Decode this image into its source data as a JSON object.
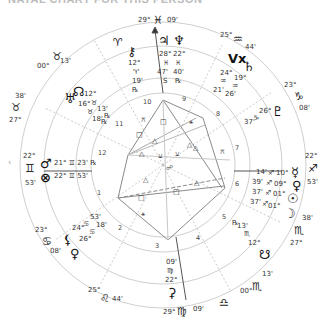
{
  "title": "NATAL CHART FOR THIS PERSON",
  "nav": {
    "left_arrow": "‹"
  },
  "colors": {
    "ring": "#cccccc",
    "axis": "#555555",
    "aspect_hard": "#888888",
    "aspect_soft": "#aaaaaa",
    "text": "#333333"
  },
  "cusps": {
    "mc": {
      "deg": "29°",
      "sign": "♓",
      "min": "09'"
    },
    "h11": {
      "deg": "00°",
      "sign": "♉",
      "min": "13'"
    },
    "h12": {
      "deg": "27°",
      "sign": "♉",
      "min": "38'"
    },
    "asc": {
      "deg": "22°",
      "sign": "♊",
      "min": "53'"
    },
    "h2": {
      "deg": "23°",
      "sign": "♋",
      "min": "08'"
    },
    "h3": {
      "deg": "25°",
      "sign": "♌",
      "min": "44'"
    },
    "ic": {
      "deg": "29°",
      "sign": "♍",
      "min": "09'"
    },
    "h5": {
      "deg": "00°",
      "sign": "♏",
      "min": "13'"
    },
    "h6": {
      "deg": "27°",
      "sign": "♏",
      "min": "38'"
    },
    "dsc": {
      "deg": "22°",
      "sign": "♐",
      "min": "53'"
    },
    "h8": {
      "deg": "23°",
      "sign": "♑",
      "min": "08'"
    },
    "h9": {
      "deg": "25°",
      "sign": "♒",
      "min": "44'"
    }
  },
  "intercepted_signs": {
    "aries": "♈",
    "libra": "♎"
  },
  "house_numbers": [
    "1",
    "2",
    "3",
    "4",
    "5",
    "6",
    "7",
    "8",
    "9",
    "10",
    "11",
    "12"
  ],
  "planets": {
    "jupiter": {
      "glyph": "♃",
      "deg": "28°",
      "sign": "♓",
      "min": "47'",
      "flag": "S"
    },
    "neptune": {
      "glyph": "♆",
      "deg": "22°",
      "sign": "♓",
      "min": "40'",
      "flag": "℞"
    },
    "chiron": {
      "glyph": "⚷",
      "deg": "12°",
      "sign": "♈",
      "min": "19'",
      "flag": "℞"
    },
    "north_node": {
      "glyph": "☊",
      "deg": "12°",
      "sign": "♉",
      "min": "13'",
      "flag": "℞"
    },
    "uranus": {
      "glyph": "♅",
      "deg": "16°",
      "sign": "♉",
      "min": "18'",
      "flag": "℞"
    },
    "mars": {
      "glyph": "♂",
      "text": "21° ♊ 23' ℞"
    },
    "pof": {
      "glyph": "⊗",
      "text": "22° ♊ 53'"
    },
    "lilith": {
      "glyph": "⚸",
      "deg": "24°",
      "sign": "♋",
      "min": "53'"
    },
    "venus2": {
      "glyph": "♀",
      "deg": "26°",
      "sign": "♋",
      "min": "18'"
    },
    "juno_ic": {
      "glyph": "⚳",
      "deg": "22°",
      "sign": "♍",
      "min": "09'"
    },
    "south_node": {
      "glyph": "☋",
      "deg": "12°",
      "sign": "♏",
      "min": "13'",
      "flag": "℞"
    },
    "moon": {
      "glyph": "☽",
      "deg": "01°",
      "sign": "♐",
      "min": "37'"
    },
    "sun": {
      "glyph": "☉",
      "deg": "01°",
      "sign": "♐",
      "min": "37'"
    },
    "venus": {
      "glyph": "♀",
      "deg": "09°",
      "sign": "♐",
      "min": "39'"
    },
    "mercury": {
      "glyph": "☿",
      "deg": "10°",
      "sign": "♐",
      "min": "14'"
    },
    "pluto": {
      "glyph": "♇",
      "deg": "26°",
      "sign": "♑",
      "min": "37'"
    },
    "vertex": {
      "glyph": "Vx",
      "deg": "24°",
      "sign": "♒",
      "min": "21'"
    },
    "saturn": {
      "glyph": "♄",
      "deg": "19°",
      "sign": "♒",
      "min": "26'"
    }
  },
  "aspect_glyphs": {
    "trine": "△",
    "square": "□",
    "sextile": "⚹",
    "quincunx": "⚻",
    "semisextile": "⚺",
    "opposition": "☍"
  }
}
